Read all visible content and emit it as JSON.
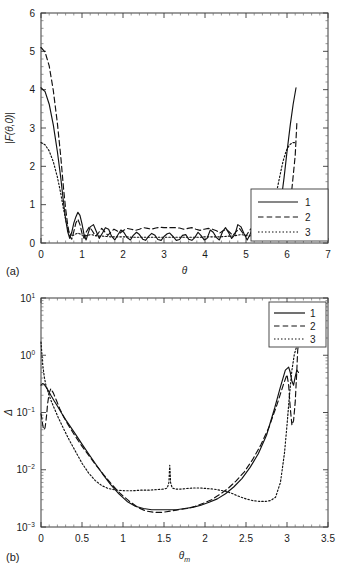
{
  "figure": {
    "panel_a_tag": "(a)",
    "panel_b_tag": "(b)"
  },
  "chart_data": [
    {
      "id": "panel-a",
      "type": "line",
      "title": "",
      "xlabel": "θ",
      "ylabel": "|F(θ,0)|",
      "xlim": [
        0,
        7
      ],
      "ylim": [
        0,
        6
      ],
      "xticks": [
        0,
        1,
        2,
        3,
        4,
        5,
        6,
        7
      ],
      "xticklabels": [
        "0",
        "1",
        "2",
        "3",
        "4",
        "5",
        "6",
        "7"
      ],
      "yticks": [
        0,
        1,
        2,
        3,
        4,
        5,
        6
      ],
      "yticklabels": [
        "0",
        "1",
        "2",
        "3",
        "4",
        "5",
        "6"
      ],
      "grid": false,
      "legend_position": "lower-right",
      "legend": [
        "1",
        "2",
        "3"
      ],
      "series": [
        {
          "name": "1",
          "style": "solid",
          "x": [
            0.0,
            0.1,
            0.2,
            0.3,
            0.4,
            0.48,
            0.55,
            0.6,
            0.65,
            0.7,
            0.75,
            0.8,
            0.85,
            0.9,
            0.95,
            1.0,
            1.05,
            1.1,
            1.15,
            1.2,
            1.28,
            1.35,
            1.42,
            1.5,
            1.57,
            1.65,
            1.72,
            1.8,
            1.88,
            1.95,
            2.02,
            2.1,
            2.18,
            2.25,
            2.33,
            2.4,
            2.48,
            2.55,
            2.63,
            2.7,
            2.78,
            2.85,
            2.93,
            3.0,
            3.08,
            3.14,
            3.22,
            3.3,
            3.38,
            3.45,
            3.53,
            3.6,
            3.68,
            3.75,
            3.83,
            3.9,
            3.98,
            4.05,
            4.13,
            4.2,
            4.28,
            4.35,
            4.43,
            4.5,
            4.58,
            4.65,
            4.73,
            4.8,
            4.88,
            4.95,
            5.03,
            5.1,
            5.18,
            5.25,
            5.33,
            5.4,
            5.48,
            5.55,
            5.63,
            5.7,
            5.78,
            5.85,
            5.93,
            6.0,
            6.08,
            6.15,
            6.22
          ],
          "y": [
            4.05,
            3.95,
            3.62,
            3.08,
            2.38,
            1.72,
            1.05,
            0.62,
            0.3,
            0.12,
            0.28,
            0.52,
            0.68,
            0.8,
            0.72,
            0.5,
            0.22,
            0.08,
            0.25,
            0.42,
            0.48,
            0.3,
            0.12,
            0.26,
            0.4,
            0.36,
            0.18,
            0.08,
            0.22,
            0.34,
            0.28,
            0.14,
            0.08,
            0.2,
            0.28,
            0.22,
            0.1,
            0.07,
            0.18,
            0.25,
            0.2,
            0.09,
            0.07,
            0.17,
            0.24,
            0.26,
            0.17,
            0.07,
            0.09,
            0.2,
            0.22,
            0.1,
            0.07,
            0.14,
            0.28,
            0.2,
            0.08,
            0.12,
            0.34,
            0.28,
            0.14,
            0.08,
            0.3,
            0.4,
            0.26,
            0.12,
            0.22,
            0.48,
            0.42,
            0.25,
            0.08,
            0.22,
            0.5,
            0.72,
            0.8,
            0.68,
            0.52,
            0.28,
            0.12,
            0.3,
            0.62,
            1.05,
            1.72,
            2.38,
            3.08,
            3.62,
            4.05
          ]
        },
        {
          "name": "2",
          "style": "dashed",
          "x": [
            0.0,
            0.1,
            0.2,
            0.3,
            0.4,
            0.48,
            0.55,
            0.6,
            0.65,
            0.7,
            0.75,
            0.8,
            0.85,
            0.9,
            0.95,
            1.0,
            1.05,
            1.1,
            1.18,
            1.25,
            1.33,
            1.4,
            1.48,
            1.55,
            1.63,
            1.7,
            1.78,
            1.85,
            1.93,
            2.0,
            2.1,
            2.2,
            2.3,
            2.4,
            2.5,
            2.6,
            2.7,
            2.8,
            2.9,
            3.0,
            3.14,
            3.28,
            3.38,
            3.48,
            3.58,
            3.68,
            3.78,
            3.88,
            3.98,
            4.08,
            4.18,
            4.28,
            4.36,
            4.44,
            4.52,
            4.6,
            4.68,
            4.76,
            4.84,
            4.92,
            5.0,
            5.08,
            5.16,
            5.24,
            5.32,
            5.4,
            5.48,
            5.56,
            5.64,
            5.72,
            5.8,
            5.88,
            5.96,
            6.04,
            6.12,
            6.2,
            6.24
          ],
          "y": [
            5.1,
            4.98,
            4.62,
            3.98,
            3.12,
            2.28,
            1.42,
            0.9,
            0.48,
            0.18,
            0.1,
            0.3,
            0.52,
            0.62,
            0.48,
            0.25,
            0.12,
            0.28,
            0.42,
            0.32,
            0.18,
            0.26,
            0.38,
            0.3,
            0.2,
            0.28,
            0.36,
            0.32,
            0.26,
            0.32,
            0.38,
            0.36,
            0.33,
            0.36,
            0.4,
            0.38,
            0.36,
            0.39,
            0.41,
            0.4,
            0.4,
            0.4,
            0.39,
            0.36,
            0.38,
            0.4,
            0.36,
            0.33,
            0.36,
            0.38,
            0.36,
            0.32,
            0.26,
            0.32,
            0.36,
            0.28,
            0.2,
            0.3,
            0.38,
            0.26,
            0.18,
            0.32,
            0.42,
            0.28,
            0.12,
            0.25,
            0.48,
            0.62,
            0.52,
            0.3,
            0.1,
            0.18,
            0.48,
            0.9,
            1.42,
            2.28,
            3.12
          ]
        },
        {
          "name": "3",
          "style": "dotted",
          "x": [
            0.0,
            0.1,
            0.2,
            0.3,
            0.4,
            0.48,
            0.55,
            0.62,
            0.68,
            0.75,
            0.82,
            0.9,
            0.98,
            1.06,
            1.14,
            1.22,
            1.3,
            1.4,
            1.5,
            1.6,
            1.7,
            1.8,
            1.9,
            2.0,
            2.1,
            2.2,
            2.3,
            2.4,
            2.5,
            2.6,
            2.7,
            2.8,
            2.9,
            3.0,
            3.14,
            3.28,
            3.38,
            3.48,
            3.58,
            3.68,
            3.78,
            3.88,
            3.98,
            4.08,
            4.18,
            4.28,
            4.38,
            4.48,
            4.58,
            4.68,
            4.78,
            4.88,
            4.98,
            5.08,
            5.18,
            5.26,
            5.34,
            5.42,
            5.5,
            5.58,
            5.66,
            5.74,
            5.82,
            5.9,
            5.98,
            6.06,
            6.14,
            6.22
          ],
          "y": [
            2.62,
            2.56,
            2.4,
            2.12,
            1.72,
            1.3,
            0.88,
            0.52,
            0.28,
            0.18,
            0.22,
            0.26,
            0.22,
            0.18,
            0.2,
            0.22,
            0.2,
            0.18,
            0.18,
            0.17,
            0.16,
            0.16,
            0.16,
            0.16,
            0.16,
            0.15,
            0.15,
            0.15,
            0.15,
            0.15,
            0.15,
            0.15,
            0.15,
            0.15,
            0.15,
            0.15,
            0.15,
            0.15,
            0.15,
            0.15,
            0.15,
            0.15,
            0.16,
            0.16,
            0.16,
            0.16,
            0.16,
            0.17,
            0.18,
            0.18,
            0.2,
            0.22,
            0.2,
            0.18,
            0.22,
            0.26,
            0.22,
            0.18,
            0.28,
            0.52,
            0.88,
            1.3,
            1.72,
            2.12,
            2.4,
            2.56,
            2.62,
            2.62
          ]
        }
      ]
    },
    {
      "id": "panel-b",
      "type": "line",
      "title": "",
      "xlabel": "θm",
      "ylabel": "Δ",
      "yscale": "log",
      "xlim": [
        0,
        3.5
      ],
      "ylim": [
        0.001,
        10
      ],
      "xticks": [
        0,
        0.5,
        1,
        1.5,
        2,
        2.5,
        3,
        3.5
      ],
      "xticklabels": [
        "0",
        "0.5",
        "1",
        "1.5",
        "2",
        "2.5",
        "3",
        "3.5"
      ],
      "yticks": [
        0.001,
        0.01,
        0.1,
        1,
        10
      ],
      "yticklabels": [
        "10-3",
        "10-2",
        "10-1",
        "100",
        "101"
      ],
      "grid": false,
      "legend_position": "upper-right",
      "legend": [
        "1",
        "2",
        "3"
      ],
      "series": [
        {
          "name": "1",
          "style": "solid",
          "x": [
            0.0,
            0.02,
            0.04,
            0.06,
            0.09,
            0.12,
            0.16,
            0.2,
            0.25,
            0.3,
            0.36,
            0.42,
            0.5,
            0.58,
            0.66,
            0.75,
            0.85,
            0.95,
            1.05,
            1.15,
            1.25,
            1.35,
            1.45,
            1.55,
            1.65,
            1.75,
            1.85,
            1.95,
            2.05,
            2.15,
            2.25,
            2.35,
            2.45,
            2.55,
            2.65,
            2.75,
            2.85,
            2.92,
            2.98,
            3.02,
            3.04,
            3.06,
            3.08,
            3.1,
            3.12,
            3.14
          ],
          "y": [
            0.3,
            0.32,
            0.31,
            0.28,
            0.24,
            0.2,
            0.16,
            0.13,
            0.098,
            0.075,
            0.056,
            0.042,
            0.028,
            0.019,
            0.013,
            0.0085,
            0.0055,
            0.0038,
            0.0028,
            0.0023,
            0.0021,
            0.002,
            0.002,
            0.002,
            0.002,
            0.0021,
            0.0022,
            0.0024,
            0.0027,
            0.0031,
            0.0038,
            0.005,
            0.007,
            0.011,
            0.019,
            0.04,
            0.12,
            0.28,
            0.55,
            0.62,
            0.5,
            0.35,
            0.3,
            0.42,
            0.55,
            0.5
          ]
        },
        {
          "name": "2",
          "style": "dashed",
          "x": [
            0.0,
            0.01,
            0.02,
            0.03,
            0.04,
            0.05,
            0.06,
            0.07,
            0.08,
            0.1,
            0.12,
            0.15,
            0.19,
            0.23,
            0.28,
            0.34,
            0.41,
            0.49,
            0.58,
            0.67,
            0.77,
            0.87,
            0.97,
            1.08,
            1.18,
            1.28,
            1.38,
            1.48,
            1.58,
            1.68,
            1.78,
            1.88,
            1.98,
            2.08,
            2.18,
            2.28,
            2.38,
            2.48,
            2.58,
            2.68,
            2.78,
            2.88,
            2.96,
            3.0,
            3.02,
            3.04,
            3.06,
            3.08,
            3.1,
            3.12,
            3.13,
            3.14
          ],
          "y": [
            0.095,
            0.08,
            0.062,
            0.052,
            0.05,
            0.055,
            0.07,
            0.095,
            0.14,
            0.22,
            0.26,
            0.22,
            0.16,
            0.115,
            0.082,
            0.058,
            0.04,
            0.027,
            0.018,
            0.012,
            0.008,
            0.0054,
            0.0038,
            0.0028,
            0.0022,
            0.0019,
            0.0018,
            0.0018,
            0.0019,
            0.002,
            0.0021,
            0.0023,
            0.0026,
            0.003,
            0.0037,
            0.0047,
            0.0064,
            0.0092,
            0.015,
            0.027,
            0.055,
            0.14,
            0.32,
            0.46,
            0.3,
            0.12,
            0.06,
            0.072,
            0.15,
            0.55,
            1.2,
            1.6
          ]
        },
        {
          "name": "3",
          "style": "dotted",
          "x": [
            0.0,
            0.01,
            0.02,
            0.04,
            0.06,
            0.09,
            0.12,
            0.16,
            0.21,
            0.27,
            0.34,
            0.42,
            0.5,
            0.58,
            0.66,
            0.74,
            0.82,
            0.92,
            1.02,
            1.12,
            1.22,
            1.32,
            1.42,
            1.5,
            1.54,
            1.56,
            1.565,
            1.57,
            1.575,
            1.58,
            1.6,
            1.64,
            1.7,
            1.78,
            1.86,
            1.94,
            2.02,
            2.1,
            2.18,
            2.26,
            2.34,
            2.42,
            2.5,
            2.58,
            2.66,
            2.74,
            2.8,
            2.86,
            2.92,
            2.97,
            3.0,
            3.03,
            3.06,
            3.09,
            3.12,
            3.14
          ],
          "y": [
            1.7,
            1.1,
            0.7,
            0.42,
            0.3,
            0.22,
            0.165,
            0.12,
            0.082,
            0.054,
            0.034,
            0.021,
            0.013,
            0.0088,
            0.0065,
            0.0053,
            0.0047,
            0.0044,
            0.0043,
            0.0043,
            0.0044,
            0.0044,
            0.0045,
            0.0046,
            0.0048,
            0.006,
            0.009,
            0.012,
            0.009,
            0.006,
            0.0048,
            0.0046,
            0.0046,
            0.0047,
            0.0048,
            0.0048,
            0.0047,
            0.0046,
            0.0044,
            0.0042,
            0.0038,
            0.0034,
            0.0031,
            0.0029,
            0.0028,
            0.0028,
            0.0029,
            0.0033,
            0.006,
            0.02,
            0.06,
            0.2,
            0.55,
            1.05,
            1.45,
            1.6
          ]
        }
      ]
    }
  ]
}
